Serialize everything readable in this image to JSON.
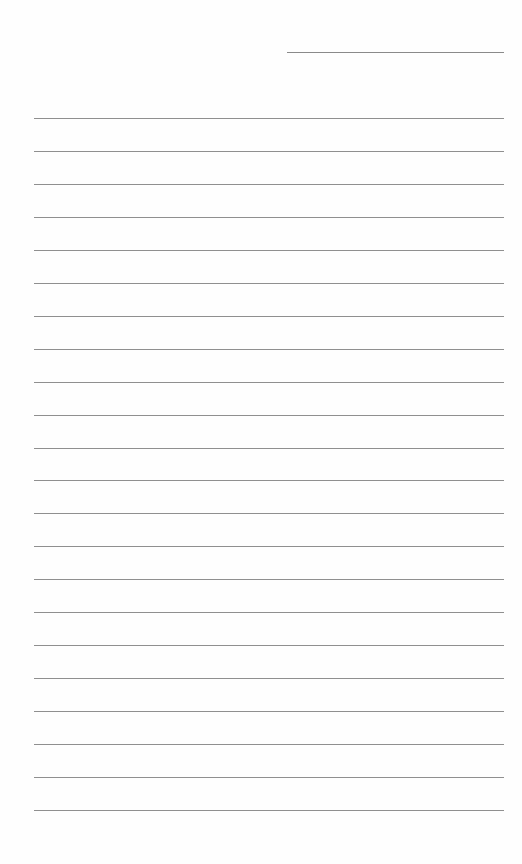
{
  "document": {
    "type": "lined-paper",
    "header_line": {
      "present": true,
      "text": ""
    },
    "rule_count": 22,
    "rule_color": "#8f8f8f",
    "lines": [
      "",
      "",
      "",
      "",
      "",
      "",
      "",
      "",
      "",
      "",
      "",
      "",
      "",
      "",
      "",
      "",
      "",
      "",
      "",
      "",
      "",
      ""
    ]
  }
}
